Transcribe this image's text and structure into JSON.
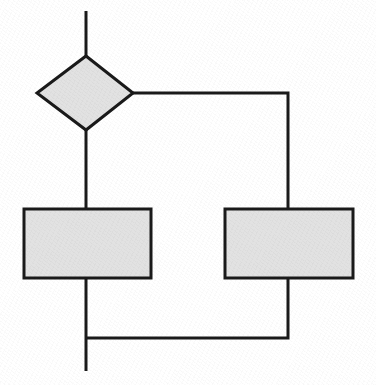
{
  "diagram": {
    "type": "flowchart",
    "title": "",
    "canvas": {
      "width": 376,
      "height": 385,
      "background_color": "#ffffff"
    },
    "style": {
      "shape_fill_color": "#e2e2e2",
      "shape_stroke_color": "#1a1a1a",
      "shape_stroke_width": 3,
      "connector_color": "#1a1a1a",
      "connector_width": 3
    },
    "nodes": [
      {
        "id": "decision-1",
        "shape": "diamond",
        "label": "",
        "fill": "#e2e2e2",
        "stroke": "#1a1a1a",
        "center_x": 86,
        "center_y": 93,
        "half_width": 48,
        "half_height": 37,
        "points": "86,56 133,93 86,130 37,93"
      },
      {
        "id": "process-left",
        "shape": "rectangle",
        "label": "",
        "fill": "#e2e2e2",
        "stroke": "#1a1a1a",
        "x": 24,
        "y": 209,
        "width": 127,
        "height": 69
      },
      {
        "id": "process-right",
        "shape": "rectangle",
        "label": "",
        "fill": "#e2e2e2",
        "stroke": "#1a1a1a",
        "x": 225,
        "y": 209,
        "width": 128,
        "height": 69
      }
    ],
    "connectors": [
      {
        "id": "entry-to-decision",
        "label": "",
        "from": "entry",
        "to": "decision-1",
        "path": "M 86 11 L 86 56"
      },
      {
        "id": "decision-to-process-left",
        "label": "",
        "from": "decision-1",
        "to": "process-left",
        "path": "M 86 130 L 86 209"
      },
      {
        "id": "decision-to-process-right",
        "label": "",
        "from": "decision-1",
        "to": "process-right",
        "path": "M 133 93 L 288 93 L 288 209"
      },
      {
        "id": "process-left-to-exit",
        "label": "",
        "from": "process-left",
        "to": "exit",
        "path": "M 86 278 L 86 371"
      },
      {
        "id": "process-right-to-merge",
        "label": "",
        "from": "process-right",
        "to": "merge-point",
        "path": "M 288 278 L 288 338 L 86 338"
      }
    ],
    "endpoints": [
      {
        "id": "entry-stub",
        "x": 86,
        "y": 11
      },
      {
        "id": "exit-stub",
        "x": 86,
        "y": 371
      }
    ]
  }
}
